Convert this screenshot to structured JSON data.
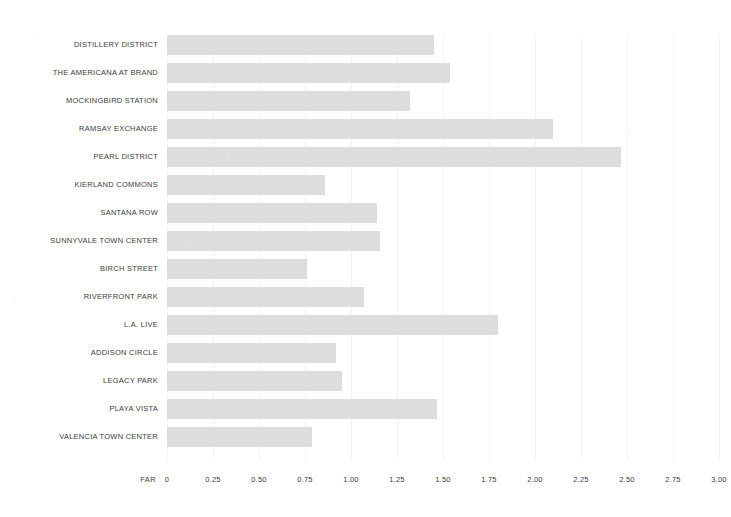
{
  "chart_data": {
    "type": "bar",
    "orientation": "horizontal",
    "title": "",
    "xlabel": "FAR",
    "ylabel": "",
    "xlim": [
      0,
      3.0
    ],
    "xticks": [
      "0",
      "0.25",
      "0.50",
      "0.75",
      "1.00",
      "1.25",
      "1.50",
      "1.75",
      "2.00",
      "2.25",
      "2.50",
      "2.75",
      "3.00"
    ],
    "xtick_values": [
      0,
      0.25,
      0.5,
      0.75,
      1.0,
      1.25,
      1.5,
      1.75,
      2.0,
      2.25,
      2.5,
      2.75,
      3.0
    ],
    "grid": true,
    "legend": null,
    "bar_color": "#dcdddf",
    "categories": [
      "DISTILLERY DISTRICT",
      "THE AMERICANA AT BRAND",
      "MOCKINGBIRD STATION",
      "RAMSAY EXCHANGE",
      "PEARL DISTRICT",
      "KIERLAND COMMONS",
      "SANTANA ROW",
      "SUNNYVALE TOWN CENTER",
      "BIRCH STREET",
      "RIVERFRONT PARK",
      "L.A. LIVE",
      "ADDISON CIRCLE",
      "LEGACY PARK",
      "PLAYA VISTA",
      "VALENCIA TOWN CENTER"
    ],
    "values": [
      1.45,
      1.54,
      1.32,
      2.1,
      2.47,
      0.86,
      1.14,
      1.16,
      0.76,
      1.07,
      1.8,
      0.92,
      0.95,
      1.47,
      0.79
    ]
  },
  "style": {
    "background": "#ffffff",
    "text_color": "#3c3c3c",
    "gridline_color": "#f1f2f3"
  }
}
